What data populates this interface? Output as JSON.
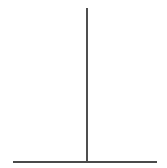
{
  "canvas": {
    "width": 167,
    "height": 168,
    "background_color": "#ffffff",
    "title": "T-shape line diagram"
  },
  "diagram": {
    "type": "line-drawing",
    "shape_name": "t-shape",
    "stroke_color": "#3c3c3c",
    "base_stroke_color": "#4a4a4a",
    "strokes": [
      {
        "name": "vertical-stem",
        "orientation": "vertical",
        "x1": 87,
        "y1": 8,
        "x2": 87,
        "y2": 162,
        "length": 154,
        "thickness": 1.8,
        "color": "#3c3c3c"
      },
      {
        "name": "horizontal-base",
        "orientation": "horizontal",
        "x1": 13,
        "y1": 162,
        "x2": 157,
        "y2": 162,
        "length": 144,
        "thickness": 1.8,
        "color": "#4a4a4a"
      }
    ],
    "junction": {
      "name": "stem-base-junction",
      "x": 87,
      "y": 162
    }
  }
}
